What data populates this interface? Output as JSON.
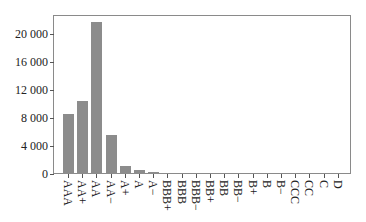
{
  "chart_data": {
    "type": "bar",
    "title": "",
    "xlabel": "",
    "ylabel": "",
    "categories": [
      "AAA",
      "AA+",
      "AA",
      "AA−",
      "A+",
      "A",
      "A−",
      "BBB+",
      "BBB",
      "BBB−",
      "BB+",
      "BB",
      "BB−",
      "B+",
      "B",
      "B−",
      "CCC",
      "CC",
      "C",
      "D"
    ],
    "values": [
      8550,
      10450,
      21700,
      5500,
      1100,
      500,
      230,
      20,
      10,
      5,
      5,
      3,
      2,
      2,
      1,
      1,
      1,
      0,
      0,
      0
    ],
    "ylim": [
      0,
      22700
    ],
    "yticks": [
      0,
      4000,
      8000,
      12000,
      16000,
      20000
    ],
    "ytick_labels": [
      "0",
      "4 000",
      "8 000",
      "12 000",
      "16 000",
      "20 000"
    ],
    "grid": false,
    "legend": null,
    "bar_color": "#8c8c8c"
  }
}
